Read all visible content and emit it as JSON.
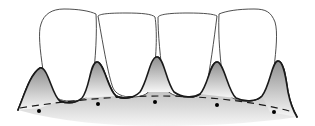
{
  "diagram": {
    "colors": {
      "background": "#ffffff",
      "outline": "#1a1a1a",
      "tooth_fill": "#ffffff",
      "tooth_outline": "#3a3a3a",
      "gum_top": "#8e8e8e",
      "gum_bottom": "#f4f4f4",
      "dash_line": "#1a1a1a",
      "dot": "#000000"
    },
    "teeth_count": 4,
    "interdental_papillae_count": 5,
    "dots_count": 5,
    "has_dashed_reference_line": true
  }
}
